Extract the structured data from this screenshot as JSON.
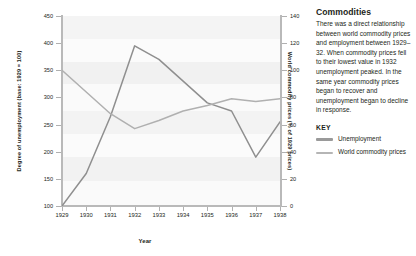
{
  "chart_data": {
    "type": "line",
    "title": "",
    "xlabel": "Year",
    "x": [
      1929,
      1930,
      1931,
      1932,
      1933,
      1934,
      1935,
      1936,
      1937,
      1938
    ],
    "xtick_labels": [
      "1929",
      "1930",
      "1931",
      "1932",
      "1933",
      "1934",
      "1935",
      "1936",
      "1937",
      "1938"
    ],
    "grid": true,
    "legend_position": "right",
    "axes": {
      "left": {
        "label": "Degree of unemployment (base: 1929 = 100)",
        "ylim": [
          100,
          450
        ],
        "ticks": [
          100,
          150,
          200,
          250,
          300,
          350,
          400,
          450
        ],
        "tick_labels": [
          "100",
          "150",
          "200",
          "250",
          "300",
          "350",
          "400",
          "450"
        ]
      },
      "right": {
        "label": "World commodity prices (% of 1929 prices)",
        "ylim": [
          0,
          140
        ],
        "ticks": [
          0,
          20,
          40,
          60,
          80,
          100,
          120,
          140
        ],
        "tick_labels": [
          "0",
          "20",
          "40",
          "60",
          "80",
          "100",
          "120",
          "140"
        ]
      }
    },
    "series": [
      {
        "name": "Unemployment",
        "axis": "left",
        "color": "#8f8f8f",
        "values": [
          100,
          160,
          265,
          395,
          370,
          330,
          290,
          275,
          190,
          255
        ]
      },
      {
        "name": "World commodity prices",
        "axis": "right",
        "color": "#b0b0b0",
        "values": [
          100,
          84,
          68,
          57,
          63,
          70,
          74,
          79,
          77,
          79
        ]
      }
    ]
  },
  "sidebar": {
    "title": "Commodities",
    "body": "There was a direct relationship between world commodity prices and employment between 1929–32. When commodity prices fell to their lowest value in 1932 unemployment peaked. In the same year commodity prices began to recover and unemployment began to decline in response.",
    "key_title": "KEY",
    "key_items": [
      {
        "label": "Unemployment",
        "color": "#9a9a9a"
      },
      {
        "label": "World commodity prices",
        "color": "#b5b5b5"
      }
    ]
  }
}
